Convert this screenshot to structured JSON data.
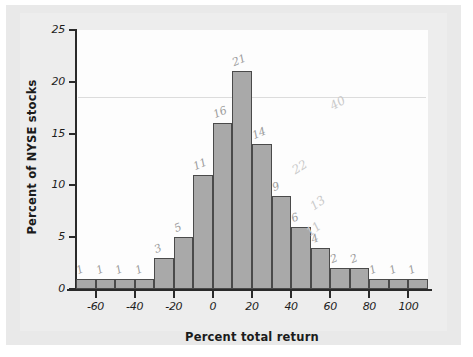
{
  "chart_data": {
    "type": "bar",
    "title": "",
    "subtitle": "",
    "xlabel": "Percent total return",
    "ylabel": "Percent of NYSE stocks",
    "xlim": [
      -70,
      110
    ],
    "ylim": [
      0,
      25
    ],
    "bin_width": 10,
    "grid": false,
    "legend": null,
    "xticks": [
      "-60",
      "-40",
      "-20",
      "0",
      "20",
      "40",
      "60",
      "80",
      "100"
    ],
    "xtick_values": [
      -60,
      -40,
      -20,
      0,
      20,
      40,
      60,
      80,
      100
    ],
    "yticks": [
      "0",
      "5",
      "10",
      "15",
      "20",
      "25"
    ],
    "ytick_values": [
      0,
      5,
      10,
      15,
      20,
      25
    ],
    "categories": [
      "-70",
      "-60",
      "-50",
      "-40",
      "-30",
      "-20",
      "-10",
      "0",
      "10",
      "20",
      "30",
      "40",
      "50",
      "60",
      "70",
      "80",
      "90",
      "100"
    ],
    "bin_starts": [
      -70,
      -60,
      -50,
      -40,
      -30,
      -20,
      -10,
      0,
      10,
      20,
      30,
      40,
      50,
      60,
      70,
      80,
      90,
      100
    ],
    "values": [
      1,
      1,
      1,
      1,
      3,
      5,
      11,
      16,
      21,
      14,
      9,
      6,
      4,
      2,
      2,
      1,
      1,
      1
    ],
    "annotations": [
      "1",
      "1",
      "1",
      "1",
      "3",
      "5",
      "11",
      "16",
      "21",
      "14",
      "9",
      "6",
      "4",
      "2",
      "2",
      "1",
      "1",
      "1"
    ],
    "stray_marks": [
      "40",
      "22",
      "13",
      "11"
    ]
  },
  "colors": {
    "bar_fill": "#a9a9a9",
    "bar_stroke": "#4a4a4a",
    "axis": "#2a2a2a",
    "paper": "#e9e9e9",
    "plot_bg": "#fdfdfd",
    "annotation": "#8b8b8b"
  }
}
